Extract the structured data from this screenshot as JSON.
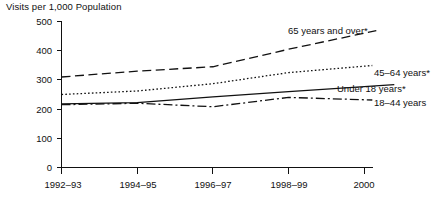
{
  "chart_data": {
    "type": "line",
    "title": "Visits per 1,000 Population",
    "xlabel": "",
    "ylabel": "",
    "grid": false,
    "legend_position": "right-inline",
    "categories": [
      "1992–93",
      "1994–95",
      "1996–97",
      "1998–99",
      "2000"
    ],
    "ylim": [
      0,
      500
    ],
    "yticks": [
      0,
      100,
      200,
      300,
      400,
      500
    ],
    "ytick_labels": [
      "0",
      "100",
      "200",
      "300",
      "400",
      "500"
    ],
    "series": [
      {
        "name": "65 years and over*",
        "label": "65 years and over*",
        "style": "dashed",
        "values": [
          310,
          330,
          345,
          405,
          460
        ]
      },
      {
        "name": "45–64 years*",
        "label": "45–64 years*",
        "style": "dotted",
        "values": [
          250,
          262,
          287,
          325,
          347
        ]
      },
      {
        "name": "Under 18 years*",
        "label": "Under 18 years*",
        "style": "solid",
        "values": [
          218,
          222,
          242,
          260,
          277
        ]
      },
      {
        "name": "18–44 years",
        "label": "18–44 years",
        "style": "dash-dot",
        "values": [
          215,
          220,
          208,
          240,
          232
        ]
      }
    ]
  },
  "axis": {
    "y_tick_labels": [
      "500",
      "400",
      "300",
      "200",
      "100",
      "0"
    ],
    "x_tick_labels": [
      "1992–93",
      "1994–95",
      "1996–97",
      "1998–99",
      "2000"
    ]
  },
  "series_labels": {
    "s0": "65 years and over*",
    "s1": "45–64 years*",
    "s2": "Under 18 years*",
    "s3": "18–44 years"
  },
  "colors": {
    "ink": "#111111",
    "background": "#ffffff"
  }
}
